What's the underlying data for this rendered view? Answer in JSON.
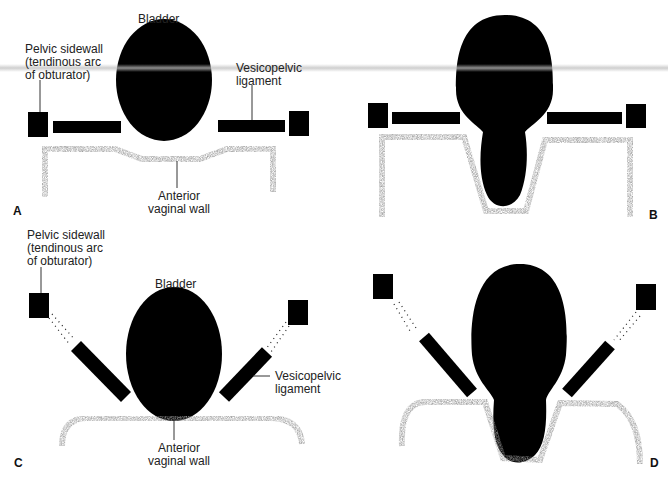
{
  "figure": {
    "panels": [
      {
        "id": "A",
        "labels": {
          "bladder": "Bladder",
          "pelvic_sidewall": "Pelvic sidewall\n(tendinous arc\nof obturator)",
          "vesicopelvic_ligament": "Vesicopelvic\nligament",
          "anterior_vaginal_wall": "Anterior\nvaginal wall"
        }
      },
      {
        "id": "B",
        "labels": {}
      },
      {
        "id": "C",
        "labels": {
          "bladder": "Bladder",
          "pelvic_sidewall": "Pelvic sidewall\n(tendinous arc\nof obturator)",
          "vesicopelvic_ligament": "Vesicopelvic\nligament",
          "anterior_vaginal_wall": "Anterior\nvaginal wall"
        }
      },
      {
        "id": "D",
        "labels": {}
      }
    ],
    "colors": {
      "structure": "#000000",
      "vaginal_wall": "#6e6e6e",
      "background": "#ffffff"
    }
  }
}
